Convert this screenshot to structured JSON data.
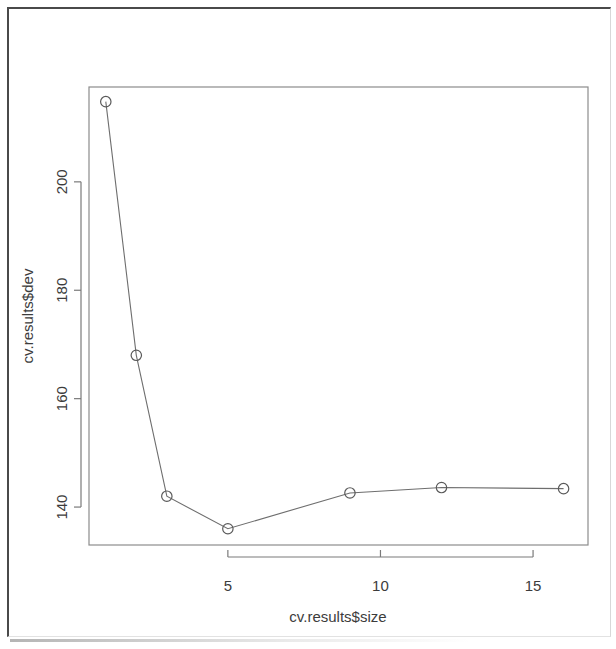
{
  "figure": {
    "kind": "r-base-plot",
    "background_color": "#ffffff",
    "ink_color": "#5a5a5a"
  },
  "chart_data": {
    "type": "line",
    "title": "",
    "subtitle": "",
    "xlabel": "cv.results$size",
    "ylabel": "cv.results$dev",
    "x": [
      1,
      2,
      3,
      5,
      9,
      12,
      16
    ],
    "values": [
      214.8,
      168.0,
      142.0,
      136.0,
      142.6,
      143.6,
      143.4
    ],
    "series": [
      {
        "name": "cv.results$dev",
        "x": [
          1,
          2,
          3,
          5,
          9,
          12,
          16
        ],
        "values": [
          214.8,
          168.0,
          142.0,
          136.0,
          142.6,
          143.6,
          143.4
        ]
      }
    ],
    "xlim": [
      0.45,
      16.8
    ],
    "ylim": [
      133.0,
      217.5
    ],
    "xticks": [
      5,
      10,
      15
    ],
    "xtick_labels": [
      "5",
      "10",
      "15"
    ],
    "yticks": [
      140,
      160,
      180,
      200
    ],
    "ytick_labels": [
      "140",
      "160",
      "180",
      "200"
    ],
    "grid": false,
    "legend": null,
    "marker": "open-circle",
    "line_type": "solid",
    "annotations": []
  },
  "axis_labels": {
    "x_title": "cv.results$size",
    "y_title": "cv.results$dev"
  }
}
